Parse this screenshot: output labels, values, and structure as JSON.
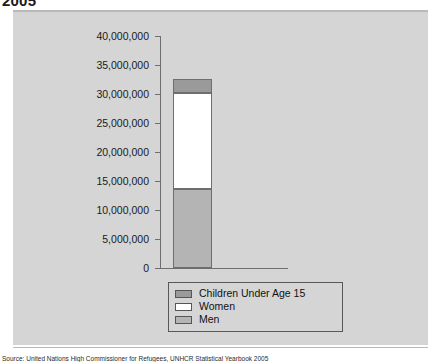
{
  "heading": {
    "text": "2005"
  },
  "caption": {
    "text": "Source: United Nations High Commissioner for Refugees, UNHCR Statistical Yearbook 2005"
  },
  "colors": {
    "panel_background": "#d5d5d5",
    "page_background": "#ffffff",
    "axis": "#6e6e6e",
    "children_segment": "#9a9a9a",
    "women_segment": "#ffffff",
    "men_segment": "#b4b4b4",
    "legend_border": "#585858",
    "text": "#1a1a1a"
  },
  "chart_data": {
    "type": "bar",
    "stacked": true,
    "title": "2005",
    "xlabel": "",
    "ylabel": "",
    "categories": [
      ""
    ],
    "ylim": [
      0,
      40000000
    ],
    "ytick_labels": [
      "40,000,000",
      "35,000,000",
      "30,000,000",
      "25,000,000",
      "20,000,000",
      "15,000,000",
      "10,000,000",
      "5,000,000",
      "0"
    ],
    "ytick_values": [
      40000000,
      35000000,
      30000000,
      25000000,
      20000000,
      15000000,
      10000000,
      5000000,
      0
    ],
    "grid": false,
    "legend_position": "bottom-center",
    "series": [
      {
        "name": "Children Under Age 15",
        "color": "#9a9a9a",
        "values": [
          2400000
        ]
      },
      {
        "name": "Women",
        "color": "#ffffff",
        "values": [
          16600000
        ]
      },
      {
        "name": "Men",
        "color": "#b4b4b4",
        "values": [
          13600000
        ]
      }
    ],
    "stack_order_bottom_to_top": [
      "Men",
      "Women",
      "Children Under Age 15"
    ],
    "total": 32600000
  },
  "legend": {
    "items": [
      {
        "label": "Children Under Age 15",
        "swatch": "#9a9a9a"
      },
      {
        "label": "Women",
        "swatch": "#ffffff"
      },
      {
        "label": "Men",
        "swatch": "#b4b4b4"
      }
    ]
  }
}
